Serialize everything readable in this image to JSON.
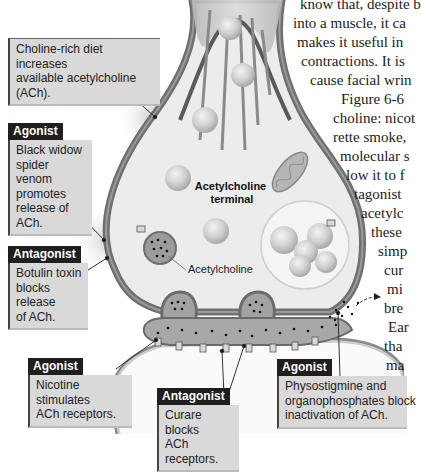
{
  "body_text_lines": [
    "know that, despite b",
    "into a muscle, it ca",
    "makes it useful in",
    "contractions. It is",
    "cause facial wrin",
    "Figure 6-6",
    "choline: nicot",
    "rette smoke,",
    "molecular s",
    "low it to f",
    "tagonist",
    "acetylc",
    "these",
    "simp",
    "cur",
    "mi",
    "bre",
    "Ear",
    "tha",
    "ma"
  ],
  "diagram": {
    "terminal_label": [
      "Acetylcholine",
      "terminal"
    ],
    "vesicle_label": "Acetylcholine"
  },
  "callouts": [
    {
      "id": "choline-diet",
      "tag": "",
      "text": [
        "Choline-rich diet increases",
        "available acetylcholine (ACh)."
      ]
    },
    {
      "id": "black-widow",
      "tag": "Agonist",
      "text": [
        "Black widow",
        "spider venom",
        "promotes",
        "release of ACh."
      ]
    },
    {
      "id": "botulin",
      "tag": "Antagonist",
      "text": [
        "Botulin toxin",
        "blocks release",
        "of ACh."
      ]
    },
    {
      "id": "nicotine",
      "tag": "Agonist",
      "text": [
        "Nicotine stimulates",
        "ACh receptors."
      ]
    },
    {
      "id": "curare",
      "tag": "Antagonist",
      "text": [
        "Curare blocks",
        "ACh receptors."
      ]
    },
    {
      "id": "physostigmine",
      "tag": "Agonist",
      "text": [
        "Physostigmine and",
        "organophosphates  block",
        "inactivation of ACh."
      ]
    }
  ],
  "colors": {
    "membrane": "#7a7a7a",
    "cytoplasm": "#ececec",
    "cleft": "#a8a8a8",
    "callout_box": "#d9d9d9",
    "tag_bg": "#1e1e1e"
  }
}
